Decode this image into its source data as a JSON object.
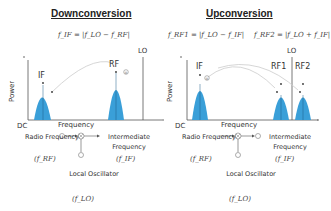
{
  "colors": {
    "peak": "#3a9fd8",
    "axis": "#555555",
    "arc": "#cccccc",
    "text": "#333333"
  },
  "downconversion": {
    "title": "Downconversion",
    "formula": "f_IF = |f_LO − f_RF|",
    "axis": {
      "y_label": "Power",
      "x_label": "Frequency",
      "origin_label": "DC"
    },
    "markers": {
      "lo": "LO",
      "if": "IF",
      "rf": "RF"
    },
    "block": {
      "input_label": "Radio Frequency",
      "input_symbol": "(f_RF)",
      "output_label": "Intermediate Frequency",
      "output_symbol": "(f_IF)",
      "lo_label": "Local Oscillator",
      "lo_symbol": "(f_LO)"
    }
  },
  "upconversion": {
    "title": "Upconversion",
    "formula_1": "f_RF1 = |f_LO − f_IF|",
    "formula_2": "f_RF2 = |f_LO + f_IF|",
    "axis": {
      "y_label": "Power",
      "x_label": "Frequency",
      "origin_label": "DC"
    },
    "markers": {
      "lo": "LO",
      "if": "IF",
      "rf1": "RF1",
      "rf2": "RF2"
    },
    "block": {
      "input_label": "Radio Frequency",
      "input_symbol": "(f_RF)",
      "output_label": "Intermediate Frequency",
      "output_symbol": "(f_IF)",
      "lo_label": "Local Oscillator",
      "lo_symbol": "(f_LO)"
    }
  }
}
